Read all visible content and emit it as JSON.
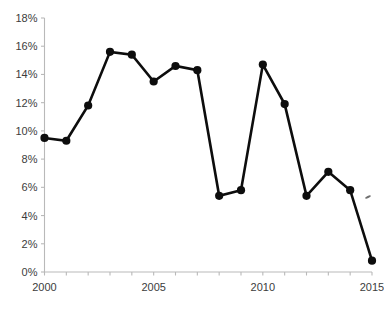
{
  "chart_data": {
    "type": "line",
    "title": "",
    "subtitle": "",
    "xlabel": "",
    "ylabel": "",
    "x": [
      2000,
      2001,
      2002,
      2003,
      2004,
      2005,
      2006,
      2007,
      2008,
      2009,
      2010,
      2011,
      2012,
      2013,
      2014,
      2015
    ],
    "values": [
      9.5,
      9.3,
      11.8,
      15.6,
      15.4,
      13.5,
      14.6,
      14.3,
      5.4,
      5.8,
      14.7,
      11.9,
      5.4,
      7.1,
      5.8,
      0.8
    ],
    "series": [
      {
        "name": "",
        "values": [
          9.5,
          9.3,
          11.8,
          15.6,
          15.4,
          13.5,
          14.6,
          14.3,
          5.4,
          5.8,
          14.7,
          11.9,
          5.4,
          7.1,
          5.8,
          0.8
        ]
      }
    ],
    "xlim": [
      2000,
      2015
    ],
    "ylim": [
      0,
      18
    ],
    "x_tick_labels": [
      "2000",
      "2005",
      "2010",
      "2015"
    ],
    "x_tick_values": [
      2000,
      2005,
      2010,
      2015
    ],
    "y_tick_labels": [
      "0%",
      "2%",
      "4%",
      "6%",
      "8%",
      "10%",
      "12%",
      "14%",
      "16%",
      "18%"
    ],
    "y_tick_values": [
      0,
      2,
      4,
      6,
      8,
      10,
      12,
      14,
      16,
      18
    ],
    "grid": false,
    "legend": null,
    "legend_position": "none",
    "annotations": [],
    "marker": "circle",
    "colors": {
      "line": "#0d0d0d",
      "marker": "#0d0d0d",
      "axis": "#b9b9b9",
      "tick_text": "#3c3c3c",
      "background": "#ffffff"
    }
  }
}
